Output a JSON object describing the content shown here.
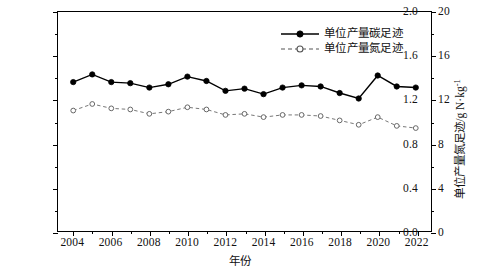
{
  "chart_data": {
    "type": "line",
    "title": "",
    "xlabel": "年份",
    "ylabel": "单位产量碳足迹/kg CO2eq·kg-1",
    "ylabel_right": "单位产量氮足迹/g N·kg-1",
    "x": [
      2004,
      2005,
      2006,
      2007,
      2008,
      2009,
      2010,
      2011,
      2012,
      2013,
      2014,
      2015,
      2016,
      2017,
      2018,
      2019,
      2020,
      2021,
      2022
    ],
    "xlim": [
      2003.2,
      2022.8
    ],
    "ylim": [
      0,
      2.0
    ],
    "ylim_right": [
      0,
      20
    ],
    "xticks": [
      2004,
      2006,
      2008,
      2010,
      2012,
      2014,
      2016,
      2018,
      2020,
      2022
    ],
    "xticks_minor": [
      2005,
      2007,
      2009,
      2011,
      2013,
      2015,
      2017,
      2019,
      2021
    ],
    "yticks": [
      0.0,
      0.4,
      0.8,
      1.2,
      1.6,
      2.0
    ],
    "yticks_minor": [
      0.2,
      0.6,
      1.0,
      1.4,
      1.8
    ],
    "yticks_right": [
      0,
      4,
      8,
      12,
      16,
      20
    ],
    "yticks_right_minor": [
      2,
      6,
      10,
      14,
      18
    ],
    "xtick_labels": [
      "2004",
      "2006",
      "2008",
      "2010",
      "2012",
      "2014",
      "2016",
      "2018",
      "2020",
      "2022"
    ],
    "ytick_labels": [
      "0.0",
      "0.4",
      "0.8",
      "1.2",
      "1.6",
      "2.0"
    ],
    "ytick_right_labels": [
      "0",
      "4",
      "8",
      "12",
      "16",
      "20"
    ],
    "grid": false,
    "legend_position": "top-right",
    "series": [
      {
        "name": "单位产量碳足迹",
        "axis": "left",
        "marker": "filled-circle",
        "linestyle": "solid",
        "color": "#000000",
        "values": [
          1.36,
          1.43,
          1.36,
          1.35,
          1.31,
          1.34,
          1.41,
          1.37,
          1.28,
          1.3,
          1.25,
          1.31,
          1.33,
          1.32,
          1.26,
          1.21,
          1.42,
          1.32,
          1.31
        ]
      },
      {
        "name": "单位产量氮足迹",
        "axis": "right",
        "marker": "open-circle",
        "linestyle": "dashed",
        "color": "#000000",
        "values": [
          11.0,
          11.6,
          11.2,
          11.1,
          10.7,
          10.9,
          11.3,
          11.1,
          10.6,
          10.7,
          10.4,
          10.6,
          10.6,
          10.5,
          10.1,
          9.7,
          10.4,
          9.6,
          9.4
        ]
      }
    ]
  },
  "legend": {
    "items": [
      {
        "label": "单位产量碳足迹",
        "symbol": "solid-filled-circle"
      },
      {
        "label": "单位产量氮足迹",
        "symbol": "dashed-open-circle"
      }
    ]
  },
  "axes": {
    "left_title_parts": {
      "main": "单位产量碳足迹/kg CO",
      "sub": "2",
      "mid": "eq·kg",
      "sup": "-1"
    },
    "right_title_parts": {
      "main": "单位产量氮足迹/g N·kg",
      "sup": "-1"
    },
    "x_title": "年份"
  }
}
